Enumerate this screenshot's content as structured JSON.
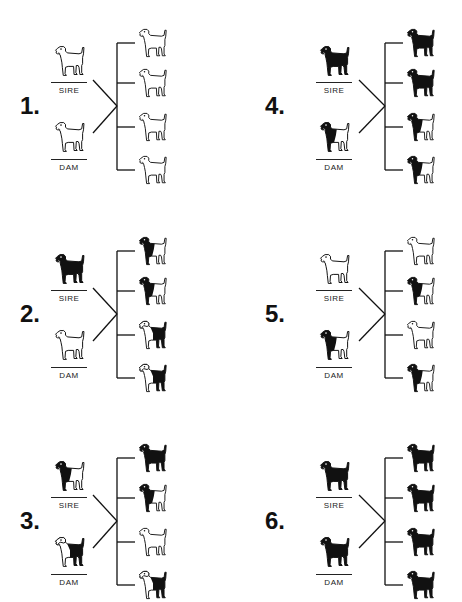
{
  "diagram": {
    "colors": {
      "ink": "#111111",
      "background": "#ffffff"
    },
    "labels": {
      "sire": "SIRE",
      "dam": "DAM"
    },
    "patterns_legend": {
      "white": "white-outline-dog",
      "black": "solid-black-dog",
      "blackfront": "black-front-half-dog",
      "blackback": "black-back-saddle-dog"
    },
    "crosses": [
      {
        "number": "1.",
        "sire": "white",
        "dam": "white",
        "offspring": [
          "white",
          "white",
          "white",
          "white"
        ]
      },
      {
        "number": "2.",
        "sire": "black",
        "dam": "white",
        "offspring": [
          "blackfront",
          "blackfront",
          "blackback",
          "blackback"
        ]
      },
      {
        "number": "3.",
        "sire": "blackfront",
        "dam": "blackback",
        "offspring": [
          "black",
          "blackfront",
          "white",
          "blackback"
        ]
      },
      {
        "number": "4.",
        "sire": "black",
        "dam": "blackfront",
        "offspring": [
          "black",
          "black",
          "blackfront",
          "blackfront"
        ]
      },
      {
        "number": "5.",
        "sire": "white",
        "dam": "blackfront",
        "offspring": [
          "white",
          "blackfront",
          "white",
          "blackfront"
        ]
      },
      {
        "number": "6.",
        "sire": "black",
        "dam": "black",
        "offspring": [
          "black",
          "black",
          "black",
          "black"
        ]
      }
    ]
  }
}
